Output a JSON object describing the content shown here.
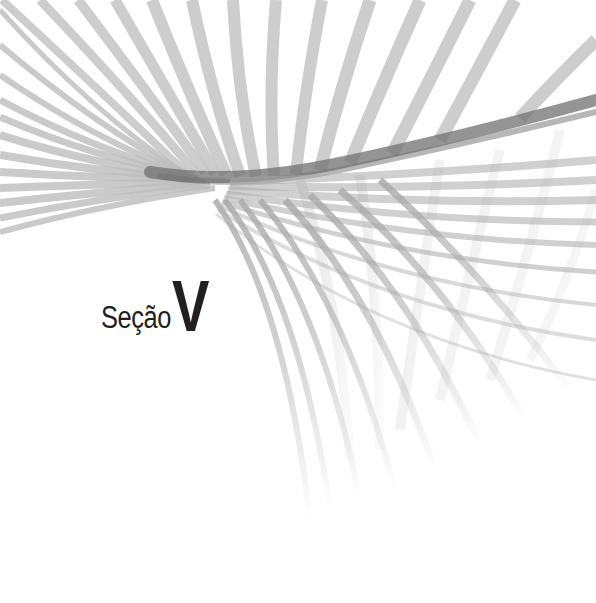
{
  "page": {
    "type": "section-divider",
    "background": "#ffffff"
  },
  "heading": {
    "word": "Seção",
    "numeral": "V",
    "color": "#231f20"
  },
  "artwork": {
    "description": "twisted-ribbon-of-gray-stripes",
    "stripe_color": "#b4b4b4",
    "core_color": "#6e6e6e"
  }
}
